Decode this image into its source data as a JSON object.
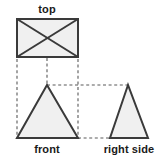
{
  "figure": {
    "title_text": "",
    "type": "orthographic-projection-diagram",
    "background_color": "#ffffff",
    "shape_fill_color": "#f0f0f0",
    "shape_stroke_color": "#3a3a3a",
    "projection_line_color": "#5a5a5a",
    "label_color": "#1a1a1a"
  },
  "views": {
    "top": {
      "label": "top",
      "label_x": 47,
      "label_y": 13,
      "shape": "rectangle-with-diagonals",
      "rect": {
        "x": 17,
        "y": 19,
        "width": 61,
        "height": 38
      },
      "diagonals": [
        {
          "x1": 17,
          "y1": 19,
          "x2": 78,
          "y2": 57
        },
        {
          "x1": 78,
          "y1": 19,
          "x2": 17,
          "y2": 57
        }
      ]
    },
    "front": {
      "label": "front",
      "label_x": 47,
      "label_y": 153,
      "shape": "triangle",
      "points": "47,85 17,138 78,138"
    },
    "right_side": {
      "label": "right side",
      "label_x": 129,
      "label_y": 153,
      "shape": "triangle",
      "points": "128,85 110,138 148,138"
    }
  },
  "projection_lines": {
    "vertical": [
      {
        "name": "left-edge-projector",
        "x1": 17,
        "y1": 59,
        "x2": 17,
        "y2": 138
      },
      {
        "name": "center-apex-projector",
        "x1": 47,
        "y1": 30,
        "x2": 47,
        "y2": 85
      },
      {
        "name": "right-edge-projector",
        "x1": 78,
        "y1": 59,
        "x2": 78,
        "y2": 138
      }
    ],
    "horizontal": [
      {
        "name": "apex-height-projector",
        "x1": 47,
        "y1": 85,
        "x2": 128,
        "y2": 85
      },
      {
        "name": "base-height-projector",
        "x1": 78,
        "y1": 138,
        "x2": 110,
        "y2": 138
      }
    ]
  }
}
